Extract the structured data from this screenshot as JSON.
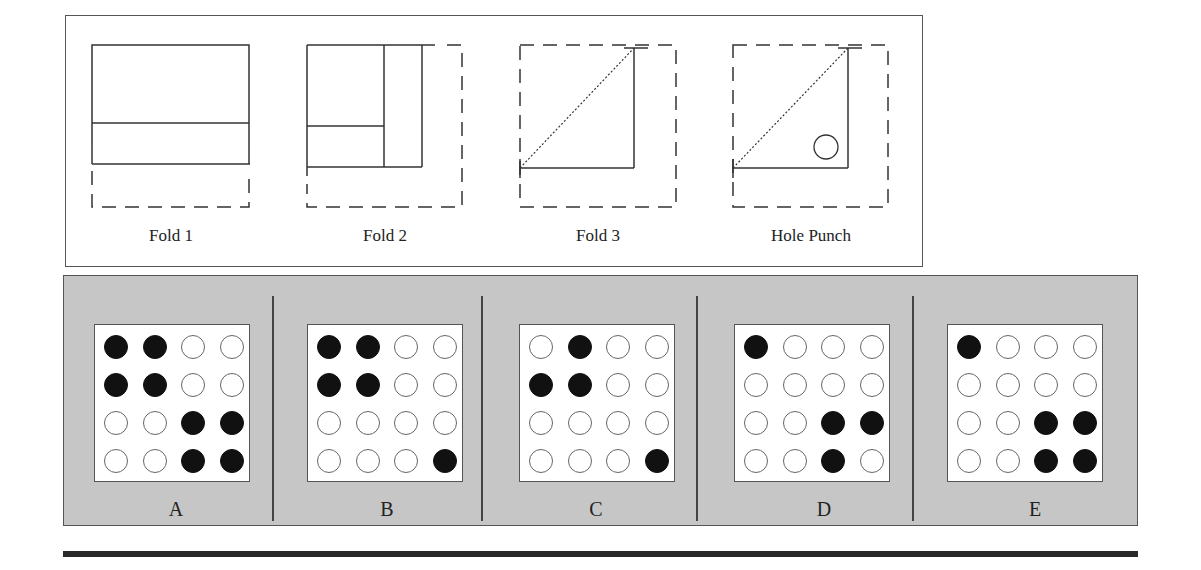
{
  "question": {
    "type": "paper-folding-hole-punch",
    "steps": [
      {
        "label": "Fold 1",
        "icon": "fold-1-diagram"
      },
      {
        "label": "Fold 2",
        "icon": "fold-2-diagram"
      },
      {
        "label": "Fold 3",
        "icon": "fold-3-diagram"
      },
      {
        "label": "Hole Punch",
        "icon": "hole-punch-diagram"
      }
    ]
  },
  "answers": {
    "grid_size": 4,
    "options": [
      {
        "label": "A",
        "pattern": [
          [
            1,
            1,
            0,
            0
          ],
          [
            1,
            1,
            0,
            0
          ],
          [
            0,
            0,
            1,
            1
          ],
          [
            0,
            0,
            1,
            1
          ]
        ]
      },
      {
        "label": "B",
        "pattern": [
          [
            1,
            1,
            0,
            0
          ],
          [
            1,
            1,
            0,
            0
          ],
          [
            0,
            0,
            0,
            0
          ],
          [
            0,
            0,
            0,
            1
          ]
        ]
      },
      {
        "label": "C",
        "pattern": [
          [
            0,
            1,
            0,
            0
          ],
          [
            1,
            1,
            0,
            0
          ],
          [
            0,
            0,
            0,
            0
          ],
          [
            0,
            0,
            0,
            1
          ]
        ]
      },
      {
        "label": "D",
        "pattern": [
          [
            1,
            0,
            0,
            0
          ],
          [
            0,
            0,
            0,
            0
          ],
          [
            0,
            0,
            1,
            1
          ],
          [
            0,
            0,
            1,
            0
          ]
        ]
      },
      {
        "label": "E",
        "pattern": [
          [
            1,
            0,
            0,
            0
          ],
          [
            0,
            0,
            0,
            0
          ],
          [
            0,
            0,
            1,
            1
          ],
          [
            0,
            0,
            1,
            1
          ]
        ]
      }
    ]
  },
  "colors": {
    "panel_bg": "#c6c6c6",
    "filled_hole": "#111111",
    "empty_hole": "#ffffff",
    "border": "#555555"
  }
}
